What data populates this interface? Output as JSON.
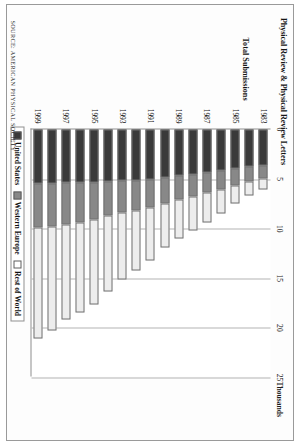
{
  "figure": {
    "title": "Physical Review\n&\nPhysical Review Letters",
    "title_lines": [
      "Physical",
      "Review",
      "&",
      "Physical",
      "Review",
      "Letters"
    ],
    "subtitle_lines": [
      "Total",
      "Submissions"
    ],
    "axis_unit": "Thousands",
    "source": "SOURCE: AMERICAN PHYSICAL SOCIETY"
  },
  "legend": {
    "items": [
      {
        "label": "United States",
        "key": "us",
        "color": "#3a3a3a"
      },
      {
        "label": "Western Europe",
        "key": "we",
        "color": "#888888"
      },
      {
        "label": "Rest of World",
        "key": "rw",
        "color": "#ffffff"
      }
    ]
  },
  "chart_data": {
    "type": "bar",
    "orientation": "horizontal",
    "stacked": true,
    "title": "Physical Review & Physical Review Letters",
    "subtitle": "Total Submissions",
    "xlabel": "Thousands",
    "ylabel": "",
    "xlim": [
      0,
      25
    ],
    "xticks": [
      0,
      5,
      10,
      15,
      20,
      25
    ],
    "grid": true,
    "legend_position": "bottom-left",
    "source": "SOURCE: AMERICAN PHYSICAL SOCIETY",
    "categories": [
      "1983",
      "1984",
      "1985",
      "1986",
      "1987",
      "1988",
      "1989",
      "1990",
      "1991",
      "1992",
      "1993",
      "1994",
      "1995",
      "1996",
      "1997",
      "1998",
      "1999"
    ],
    "tick_categories": [
      "1983",
      "1985",
      "1987",
      "1989",
      "1991",
      "1993",
      "1995",
      "1997",
      "1999"
    ],
    "series": [
      {
        "name": "United States",
        "values": [
          3.6,
          3.7,
          3.9,
          4.1,
          4.3,
          4.5,
          4.6,
          4.8,
          5.0,
          5.1,
          5.1,
          5.2,
          5.3,
          5.3,
          5.3,
          5.4,
          5.4
        ]
      },
      {
        "name": "Western Europe",
        "values": [
          1.3,
          1.5,
          1.7,
          1.9,
          2.1,
          2.3,
          2.5,
          2.7,
          2.9,
          3.1,
          3.3,
          3.5,
          3.8,
          4.1,
          4.3,
          4.4,
          4.5
        ]
      },
      {
        "name": "Rest of World",
        "values": [
          1.1,
          1.5,
          1.9,
          2.5,
          3.0,
          3.4,
          3.9,
          4.4,
          5.3,
          6.0,
          6.7,
          7.6,
          8.5,
          9.0,
          9.6,
          10.5,
          11.2
        ]
      }
    ],
    "totals": [
      6.0,
      6.7,
      7.5,
      8.5,
      9.4,
      10.2,
      11.0,
      11.9,
      13.2,
      14.2,
      15.1,
      16.3,
      17.6,
      18.4,
      19.2,
      20.3,
      21.1
    ]
  }
}
